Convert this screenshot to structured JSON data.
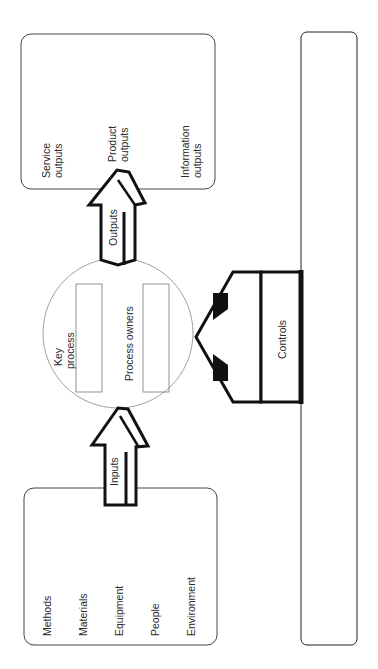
{
  "diagram": {
    "orientation": "rotated -90deg",
    "inputs_box": {
      "items": [
        "Methods",
        "Materials",
        "Equipment",
        "People",
        "Environment"
      ]
    },
    "inputs_arrow": {
      "label": "Inputs"
    },
    "key_process": {
      "title_line1": "Key",
      "title_line2": "process",
      "owners_label": "Process owners"
    },
    "outputs_arrow": {
      "label": "Outputs"
    },
    "outputs_box": {
      "items": [
        {
          "line1": "Service",
          "line2": "outputs"
        },
        {
          "line1": "Product",
          "line2": "outputs"
        },
        {
          "line1": "Information",
          "line2": "outputs"
        }
      ]
    },
    "controls": {
      "label": "Controls"
    },
    "colors": {
      "stroke": "#111111",
      "background": "#ffffff",
      "text": "#2a2a2a"
    }
  }
}
